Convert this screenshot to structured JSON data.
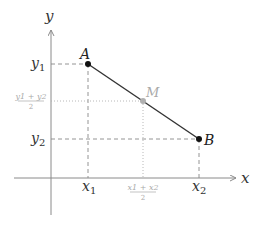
{
  "diagram": {
    "axes": {
      "x_label": "x",
      "y_label": "y"
    },
    "points": [
      {
        "id": "A",
        "label": "A",
        "x_label": "x",
        "x_sub": "1",
        "y_label": "y",
        "y_sub": "1"
      },
      {
        "id": "B",
        "label": "B",
        "x_label": "x",
        "x_sub": "2",
        "y_label": "y",
        "y_sub": "2"
      },
      {
        "id": "M",
        "label": "M",
        "x_label": "(x1+x2)/2",
        "y_label": "(y1+y2)/2"
      }
    ],
    "ticks": {
      "x1": {
        "base": "x",
        "sub": "1"
      },
      "x2": {
        "base": "x",
        "sub": "2"
      },
      "xm": {
        "num": "x1 + x2",
        "den": "2"
      },
      "y1": {
        "base": "y",
        "sub": "1"
      },
      "y2": {
        "base": "y",
        "sub": "2"
      },
      "ym": {
        "num": "y1 + y2",
        "den": "2"
      }
    },
    "colors": {
      "axis": "#8a8a8a",
      "segment": "#333333",
      "point": "#111111",
      "guide": "#888888",
      "midpoint": "#b0b0b0",
      "midpoint_label": "#aaaaaa"
    }
  }
}
